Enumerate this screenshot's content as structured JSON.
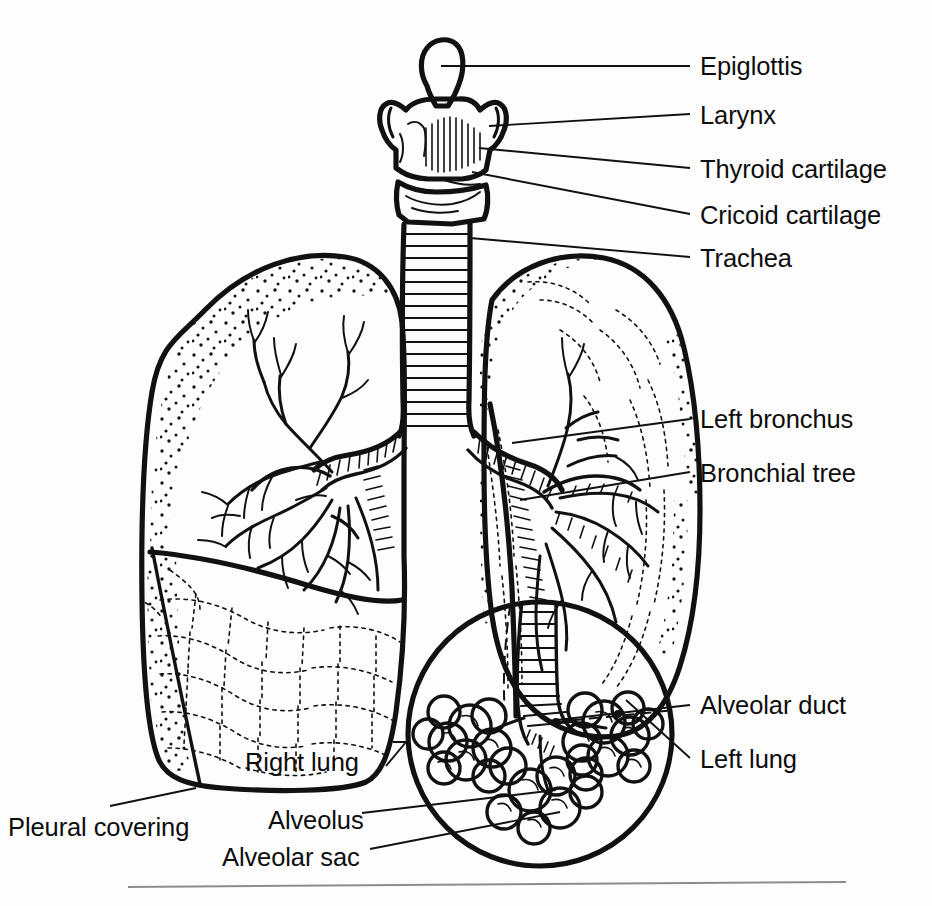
{
  "figure": {
    "background_color": "#fdfdfd",
    "ink_color": "#111111",
    "rule_color": "#8d8d8d"
  },
  "labels": {
    "epiglottis": "Epiglottis",
    "larynx": "Larynx",
    "thyroid_cartilage": "Thyroid cartilage",
    "cricoid_cartilage": "Cricoid cartilage",
    "trachea": "Trachea",
    "left_bronchus": "Left bronchus",
    "bronchial_tree": "Bronchial tree",
    "alveolar_duct": "Alveolar duct",
    "left_lung": "Left lung",
    "right_lung": "Right lung",
    "pleural_covering": "Pleural covering",
    "alveolus": "Alveolus",
    "alveolar_sac": "Alveolar sac"
  }
}
